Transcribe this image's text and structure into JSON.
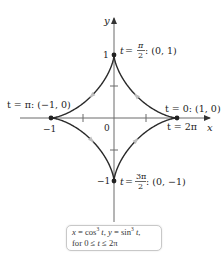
{
  "figure": {
    "type": "parametric-curve",
    "curve": {
      "x_expr": "cos³ t",
      "y_expr": "sin³ t",
      "domain": "0 ≤ t ≤ 2π",
      "color": "#2a2a2a",
      "direction_marker_color": "#bdbdbd"
    },
    "axes": {
      "x_label": "x",
      "y_label": "y",
      "origin_label": "0",
      "x_ticks": [
        "-1",
        "1"
      ],
      "y_ticks": [
        "1",
        "-1"
      ],
      "axis_color": "#6b6b6b"
    },
    "points": [
      {
        "id": "t0",
        "t_label": "t = 0: (1, 0)",
        "extra": "t = 2π",
        "coords": [
          1,
          0
        ]
      },
      {
        "id": "tpi2",
        "t_label": "t = π/2: (0, 1)",
        "coords": [
          0,
          1
        ]
      },
      {
        "id": "tpi",
        "t_label": "t = π: (−1, 0)",
        "coords": [
          -1,
          0
        ]
      },
      {
        "id": "t3pi2",
        "t_label": "t = 3π/2: (0, −1)",
        "coords": [
          0,
          -1
        ]
      }
    ],
    "labels": {
      "y_axis": "y",
      "x_axis": "x",
      "origin": "0",
      "tick_x_neg": "−1",
      "tick_y_pos": "1",
      "tick_y_neg": "−1",
      "top_t_prefix": "t = ",
      "top_frac_num": "π",
      "top_frac_den": "2",
      "top_coords": ": (0, 1)",
      "left_label": "t = π: (−1, 0)",
      "right_label": "t = 0: (1, 0)",
      "right_label2": "t = 2π",
      "bottom_t_prefix": "t = ",
      "bottom_frac_num": "3π",
      "bottom_frac_den": "2",
      "bottom_coords": ": (0, −1)"
    },
    "caption": {
      "line1_x": "x",
      "line1_eq1": " = cos",
      "line1_exp1": "3",
      "line1_t1": " t",
      "line1_sep": ", ",
      "line1_y": "y",
      "line1_eq2": " = sin",
      "line1_exp2": "3",
      "line1_t2": " t",
      "line1_end": ",",
      "line2_prefix": "for 0 ≤ ",
      "line2_t": "t",
      "line2_suffix": " ≤ 2π"
    }
  }
}
